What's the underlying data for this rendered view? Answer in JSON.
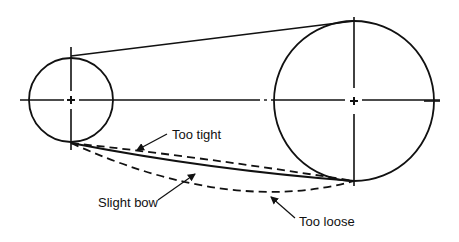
{
  "diagram": {
    "colors": {
      "stroke": "#111111",
      "background": "#ffffff"
    },
    "pulleys": [
      {
        "id": "small-pulley",
        "name": "Small pulley"
      },
      {
        "id": "large-pulley",
        "name": "Large pulley"
      }
    ],
    "belt_conditions": [
      {
        "id": "too-tight",
        "label": "Too tight",
        "style": "dashed"
      },
      {
        "id": "slight-bow",
        "label": "Slight bow",
        "style": "solid"
      },
      {
        "id": "too-loose",
        "label": "Too loose",
        "style": "dashed"
      }
    ],
    "labels": {
      "too_tight": "Too tight",
      "slight_bow": "Slight bow",
      "too_loose": "Too loose"
    }
  }
}
